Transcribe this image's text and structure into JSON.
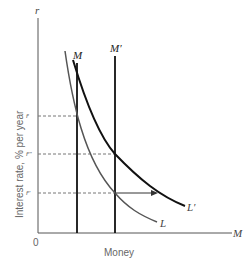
{
  "diagram": {
    "axes": {
      "y_label": "Interest rate, % per year",
      "y_symbol": "r",
      "x_label": "Money",
      "x_symbol": "M",
      "origin": "0"
    },
    "curves": {
      "supply_initial": "M",
      "supply_new": "M′",
      "demand_initial": "L",
      "demand_new": "L′"
    },
    "levels": {
      "r_bar": "r̄",
      "r_double_prime": "r̄″",
      "r_prime": "r̄′"
    },
    "colors": {
      "axis": "#555555",
      "curve_dark": "#111111",
      "curve_gray": "#555555",
      "dashed": "#777777"
    }
  }
}
